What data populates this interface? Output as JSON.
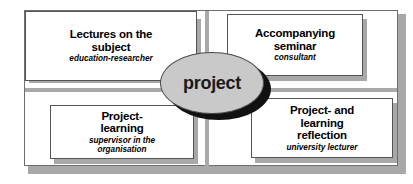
{
  "diagram": {
    "center": {
      "label": "project",
      "shape": "ellipse",
      "fill_color": "#c9c9c9",
      "shadow_color": "#111111"
    },
    "frame": {
      "border_color": "#6e6e6e",
      "shadow_color": "#a8a8a8",
      "divider_color": "#a9a9a9"
    },
    "boxes": [
      {
        "id": "lectures",
        "position": "top-left",
        "title": "Lectures on the\nsubject",
        "role": "education-researcher"
      },
      {
        "id": "seminar",
        "position": "top-right",
        "title": "Accompanying\nseminar",
        "role": "consultant"
      },
      {
        "id": "project-learning",
        "position": "bottom-left",
        "title": "Project-\nlearning",
        "role": "supervisor in the\norganisation"
      },
      {
        "id": "reflection",
        "position": "bottom-right",
        "title": "Project- and\nlearning\nreflection",
        "role": "university lecturer"
      }
    ]
  }
}
